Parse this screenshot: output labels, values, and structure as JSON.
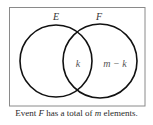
{
  "diagram": {
    "type": "venn",
    "sets": [
      {
        "label": "E",
        "cx": 56,
        "cy": 61,
        "r": 36
      },
      {
        "label": "F",
        "cx": 100,
        "cy": 61,
        "r": 37
      }
    ],
    "regions": {
      "intersection_label": "k",
      "f_only_label": "m − k"
    },
    "colors": {
      "border": "#8a8a8a",
      "circle_stroke": "#111111",
      "text": "#333333",
      "region_text": "#555555"
    }
  },
  "caption": {
    "prefix": "Event ",
    "event": "F",
    "middle": " has a total of ",
    "variable": "m",
    "suffix": " elements."
  }
}
